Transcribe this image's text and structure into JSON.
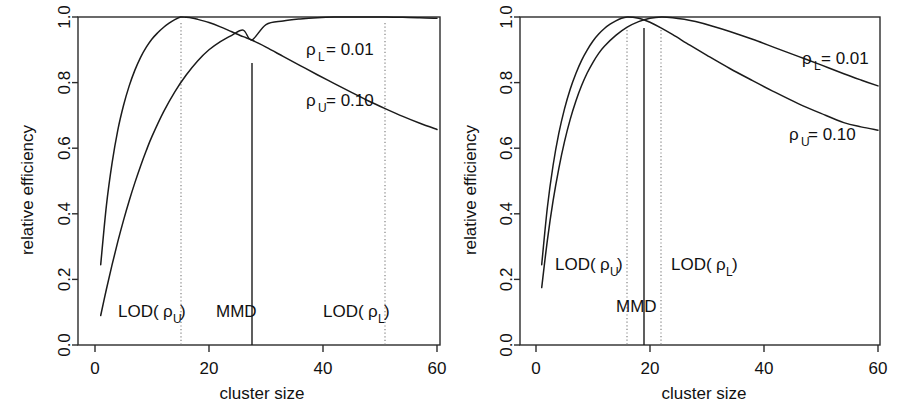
{
  "figure": {
    "panels": [
      {
        "id": "left",
        "name": "panel-left"
      },
      {
        "id": "right",
        "name": "panel-right"
      }
    ]
  },
  "axes": {
    "xlabel": "cluster size",
    "ylabel": "relative efficiency",
    "xticks": [
      "0",
      "20",
      "40",
      "60"
    ],
    "yticks": [
      "0.0",
      "0.2",
      "0.4",
      "0.6",
      "0.8",
      "1.0"
    ]
  },
  "labels": {
    "rho_l": "ρ",
    "rho_l_sub": "L",
    "rho_l_val": "= 0.01",
    "rho_u": "ρ",
    "rho_u_sub": "U",
    "rho_u_val": "= 0.10",
    "lod_open": "LOD(",
    "lod_rho": "ρ",
    "lod_sub_u": "U",
    "lod_sub_l": "L",
    "lod_close": ")",
    "mmd": "MMD"
  },
  "chart_data": [
    {
      "type": "line",
      "panel": "left",
      "title": "",
      "xlabel": "cluster size",
      "ylabel": "relative efficiency",
      "xlim": [
        0,
        60
      ],
      "ylim": [
        0.0,
        1.0
      ],
      "xticks": [
        0,
        20,
        40,
        60
      ],
      "yticks": [
        0.0,
        0.2,
        0.4,
        0.6,
        0.8,
        1.0
      ],
      "grid": false,
      "legend": "inline-annotation",
      "series": [
        {
          "name": "rho_U = 0.10",
          "label": "ρ_U = 0.10",
          "peak_x": 15,
          "peak_y": 1.0,
          "x": [
            1,
            2,
            3,
            4,
            5,
            6,
            7,
            8,
            9,
            10,
            11,
            12,
            13,
            14,
            15,
            16,
            17,
            18,
            20,
            22,
            24,
            26,
            27.5,
            30,
            33,
            36,
            39,
            42,
            45,
            48,
            51,
            54,
            57,
            60
          ],
          "y": [
            0.245,
            0.425,
            0.555,
            0.655,
            0.73,
            0.79,
            0.838,
            0.877,
            0.908,
            0.933,
            0.952,
            0.968,
            0.981,
            0.992,
            1.0,
            0.999,
            0.997,
            0.993,
            0.983,
            0.97,
            0.955,
            0.94,
            0.93,
            0.908,
            0.88,
            0.852,
            0.824,
            0.797,
            0.77,
            0.744,
            0.72,
            0.697,
            0.676,
            0.657
          ]
        },
        {
          "name": "rho_L = 0.01",
          "label": "ρ_L = 0.01",
          "peak_x": 51,
          "peak_y": 1.0,
          "x": [
            1,
            2,
            3,
            4,
            5,
            6,
            7,
            8,
            9,
            10,
            12,
            14,
            16,
            18,
            20,
            22,
            24,
            26,
            27.5,
            30,
            33,
            36,
            39,
            42,
            45,
            48,
            51,
            54,
            57,
            60
          ],
          "y": [
            0.09,
            0.17,
            0.245,
            0.315,
            0.38,
            0.44,
            0.495,
            0.546,
            0.593,
            0.636,
            0.71,
            0.772,
            0.823,
            0.866,
            0.9,
            0.925,
            0.944,
            0.96,
            0.93,
            0.977,
            0.988,
            0.994,
            0.998,
            1.0,
            1.0,
            1.0,
            1.0,
            0.999,
            0.998,
            0.996
          ]
        }
      ],
      "vertical_markers": [
        {
          "name": "LOD(rho_U)",
          "x": 15,
          "style": "dotted",
          "label": "LOD(ρ_U)"
        },
        {
          "name": "MMD",
          "x": 27.5,
          "style": "solid",
          "label": "MMD"
        },
        {
          "name": "LOD(rho_L)",
          "x": 51,
          "style": "dotted",
          "label": "LOD(ρ_L)"
        }
      ]
    },
    {
      "type": "line",
      "panel": "right",
      "title": "",
      "xlabel": "cluster size",
      "ylabel": "relative efficiency",
      "xlim": [
        0,
        60
      ],
      "ylim": [
        0.0,
        1.0
      ],
      "xticks": [
        0,
        20,
        40,
        60
      ],
      "yticks": [
        0.0,
        0.2,
        0.4,
        0.6,
        0.8,
        1.0
      ],
      "grid": false,
      "legend": "inline-annotation",
      "series": [
        {
          "name": "rho_U = 0.10",
          "label": "ρ_U = 0.10",
          "peak_x": 16,
          "peak_y": 1.0,
          "x": [
            1,
            2,
            3,
            4,
            5,
            6,
            7,
            8,
            9,
            10,
            11,
            12,
            13,
            14,
            15,
            16,
            17,
            18,
            19,
            20,
            22,
            24,
            27,
            30,
            34,
            38,
            42,
            46,
            50,
            54,
            57,
            60
          ],
          "y": [
            0.245,
            0.42,
            0.548,
            0.645,
            0.72,
            0.78,
            0.828,
            0.868,
            0.9,
            0.927,
            0.948,
            0.965,
            0.978,
            0.988,
            0.996,
            1.0,
            0.999,
            0.996,
            0.991,
            0.984,
            0.966,
            0.946,
            0.914,
            0.883,
            0.843,
            0.806,
            0.77,
            0.736,
            0.706,
            0.678,
            0.665,
            0.655
          ]
        },
        {
          "name": "rho_L = 0.01",
          "label": "ρ_L = 0.01",
          "peak_x": 22,
          "peak_y": 1.0,
          "x": [
            1,
            2,
            3,
            4,
            5,
            6,
            7,
            8,
            9,
            10,
            11,
            12,
            14,
            16,
            18,
            20,
            22,
            24,
            26,
            28,
            31,
            34,
            38,
            42,
            46,
            50,
            54,
            57,
            60
          ],
          "y": [
            0.175,
            0.32,
            0.44,
            0.538,
            0.62,
            0.688,
            0.744,
            0.791,
            0.83,
            0.862,
            0.889,
            0.911,
            0.944,
            0.969,
            0.986,
            0.996,
            1.0,
            0.998,
            0.993,
            0.986,
            0.972,
            0.956,
            0.932,
            0.906,
            0.88,
            0.854,
            0.827,
            0.808,
            0.79
          ]
        }
      ],
      "vertical_markers": [
        {
          "name": "LOD(rho_U)",
          "x": 16,
          "style": "dotted",
          "label": "LOD(ρ_U)"
        },
        {
          "name": "MMD",
          "x": 19,
          "style": "solid",
          "label": "MMD"
        },
        {
          "name": "LOD(rho_L)",
          "x": 22,
          "style": "dotted",
          "label": "LOD(ρ_L)"
        }
      ]
    }
  ]
}
